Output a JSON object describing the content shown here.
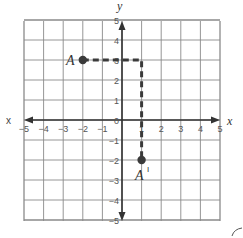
{
  "chart_data": {
    "type": "scatter",
    "title": "",
    "xlabel": "x",
    "ylabel": "y",
    "xlim": [
      -5,
      5
    ],
    "ylim": [
      -5,
      5
    ],
    "grid": true,
    "x_ticks": [
      "-5",
      "-4",
      "-3",
      "-2",
      "-1",
      "1",
      "2",
      "3",
      "4",
      "5"
    ],
    "y_ticks": [
      "5",
      "4",
      "3",
      "2",
      "1",
      "0",
      "-1",
      "-2",
      "-3",
      "-4",
      "-5"
    ],
    "origin_label": "0",
    "points": [
      {
        "label": "A",
        "x": -2,
        "y": 3
      },
      {
        "label": "A′",
        "x": 1,
        "y": -2
      }
    ],
    "path": {
      "style": "dashed",
      "vertices": [
        [
          -2,
          3
        ],
        [
          1,
          3
        ],
        [
          1,
          -2
        ]
      ]
    }
  },
  "labels": {
    "x_axis_left": "x",
    "x_axis_right": "x",
    "y_axis_top": "y",
    "point_a": "A",
    "point_a_prime": "A",
    "prime_mark": "I"
  },
  "colors": {
    "grid": "#8a8a8a",
    "axis": "#333333",
    "ink": "#3a3a3a",
    "background": "#ffffff"
  }
}
